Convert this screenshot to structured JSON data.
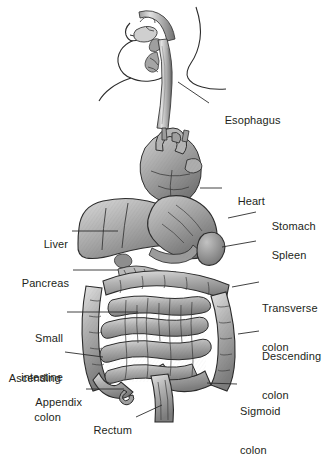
{
  "figure": {
    "background_color": "#ffffff",
    "ink_color": "#231f20",
    "style": "grayscale pen-and-ink medical illustration with leader-line callouts"
  },
  "labels": [
    {
      "id": "esophagus",
      "text": "Esophagus",
      "text2": "",
      "side": "right",
      "x": 212,
      "y": 101,
      "leader": [
        178,
        82,
        209,
        103
      ]
    },
    {
      "id": "heart",
      "text": "Heart",
      "text2": "",
      "side": "right",
      "x": 225,
      "y": 182,
      "leader": [
        200,
        188,
        222,
        188
      ]
    },
    {
      "id": "stomach",
      "text": "Stomach",
      "text2": "",
      "side": "right",
      "x": 259,
      "y": 207,
      "leader": [
        228,
        218,
        256,
        212
      ]
    },
    {
      "id": "spleen",
      "text": "Spleen",
      "text2": "",
      "side": "right",
      "x": 259,
      "y": 236,
      "leader": [
        222,
        247,
        256,
        241
      ]
    },
    {
      "id": "transverse-colon",
      "text": "Transverse",
      "text2": "colon",
      "side": "right",
      "x": 262,
      "y": 276,
      "leader": [
        232,
        287,
        259,
        282
      ]
    },
    {
      "id": "descending-colon",
      "text": "Descending",
      "text2": "colon",
      "side": "right",
      "x": 262,
      "y": 324,
      "leader": [
        238,
        334,
        259,
        331
      ]
    },
    {
      "id": "sigmoid-colon",
      "text": "Sigmoid",
      "text2": "colon",
      "side": "right",
      "x": 240,
      "y": 379,
      "leader": [
        207,
        383,
        237,
        384
      ]
    },
    {
      "id": "liver",
      "text": "Liver",
      "text2": "",
      "side": "left",
      "x": 40,
      "y": 225,
      "leader": [
        72,
        231,
        118,
        231
      ]
    },
    {
      "id": "pancreas",
      "text": "Pancreas",
      "text2": "",
      "side": "left",
      "x": 19,
      "y": 264,
      "leader": [
        73,
        270,
        118,
        270
      ]
    },
    {
      "id": "small-intestine",
      "text": "Small",
      "text2": "intestine",
      "side": "left",
      "x": 24,
      "y": 306,
      "leader": [
        67,
        312,
        138,
        312
      ]
    },
    {
      "id": "ascending-colon",
      "text": "Ascending",
      "text2": "colon",
      "side": "left",
      "x": 10,
      "y": 346,
      "leader": [
        65,
        352,
        103,
        357
      ]
    },
    {
      "id": "appendix",
      "text": "Appendix",
      "text2": "",
      "side": "left",
      "x": 33,
      "y": 383,
      "leader": [
        86,
        389,
        124,
        389
      ]
    },
    {
      "id": "rectum",
      "text": "Rectum",
      "text2": "",
      "side": "left",
      "x": 95,
      "y": 411,
      "leader": [
        136,
        417,
        162,
        405
      ]
    }
  ]
}
